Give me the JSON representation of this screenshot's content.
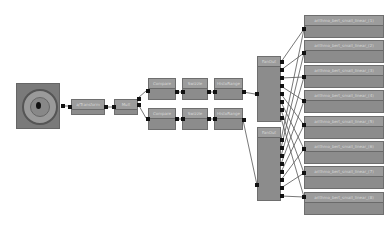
{
  "graph": {
    "source": {
      "label": "image-input",
      "type": "thumbnail"
    },
    "nodes": {
      "transform": {
        "label": "a/Transform"
      },
      "mult": {
        "label": "Mult"
      },
      "compare_top": {
        "label": "Compare"
      },
      "swizzle_top": {
        "label": "Swizzle"
      },
      "histo_top": {
        "label": "HistoRange"
      },
      "compare_bottom": {
        "label": "Compare"
      },
      "swizzle_bottom": {
        "label": "Swizzle"
      },
      "histo_bottom": {
        "label": "HistoRange"
      },
      "fanout_top": {
        "label": "FanOut"
      },
      "fanout_bottom": {
        "label": "FanOut"
      }
    },
    "outputs": [
      {
        "label": "arithmo_bert_small_linear_(1)"
      },
      {
        "label": "arithmo_bert_small_linear_(2)"
      },
      {
        "label": "arithmo_bert_small_linear_(3)"
      },
      {
        "label": "arithmo_bert_small_linear_(4)"
      },
      {
        "label": "arithmo_bert_small_linear_(5)"
      },
      {
        "label": "arithmo_bert_small_linear_(6)"
      },
      {
        "label": "arithmo_bert_small_linear_(7)"
      },
      {
        "label": "arithmo_bert_small_linear_(8)"
      }
    ]
  },
  "colors": {
    "node_body": "#8c8c8c",
    "node_title": "#9c9c9c",
    "wire": "#555555",
    "port": "#111111"
  }
}
